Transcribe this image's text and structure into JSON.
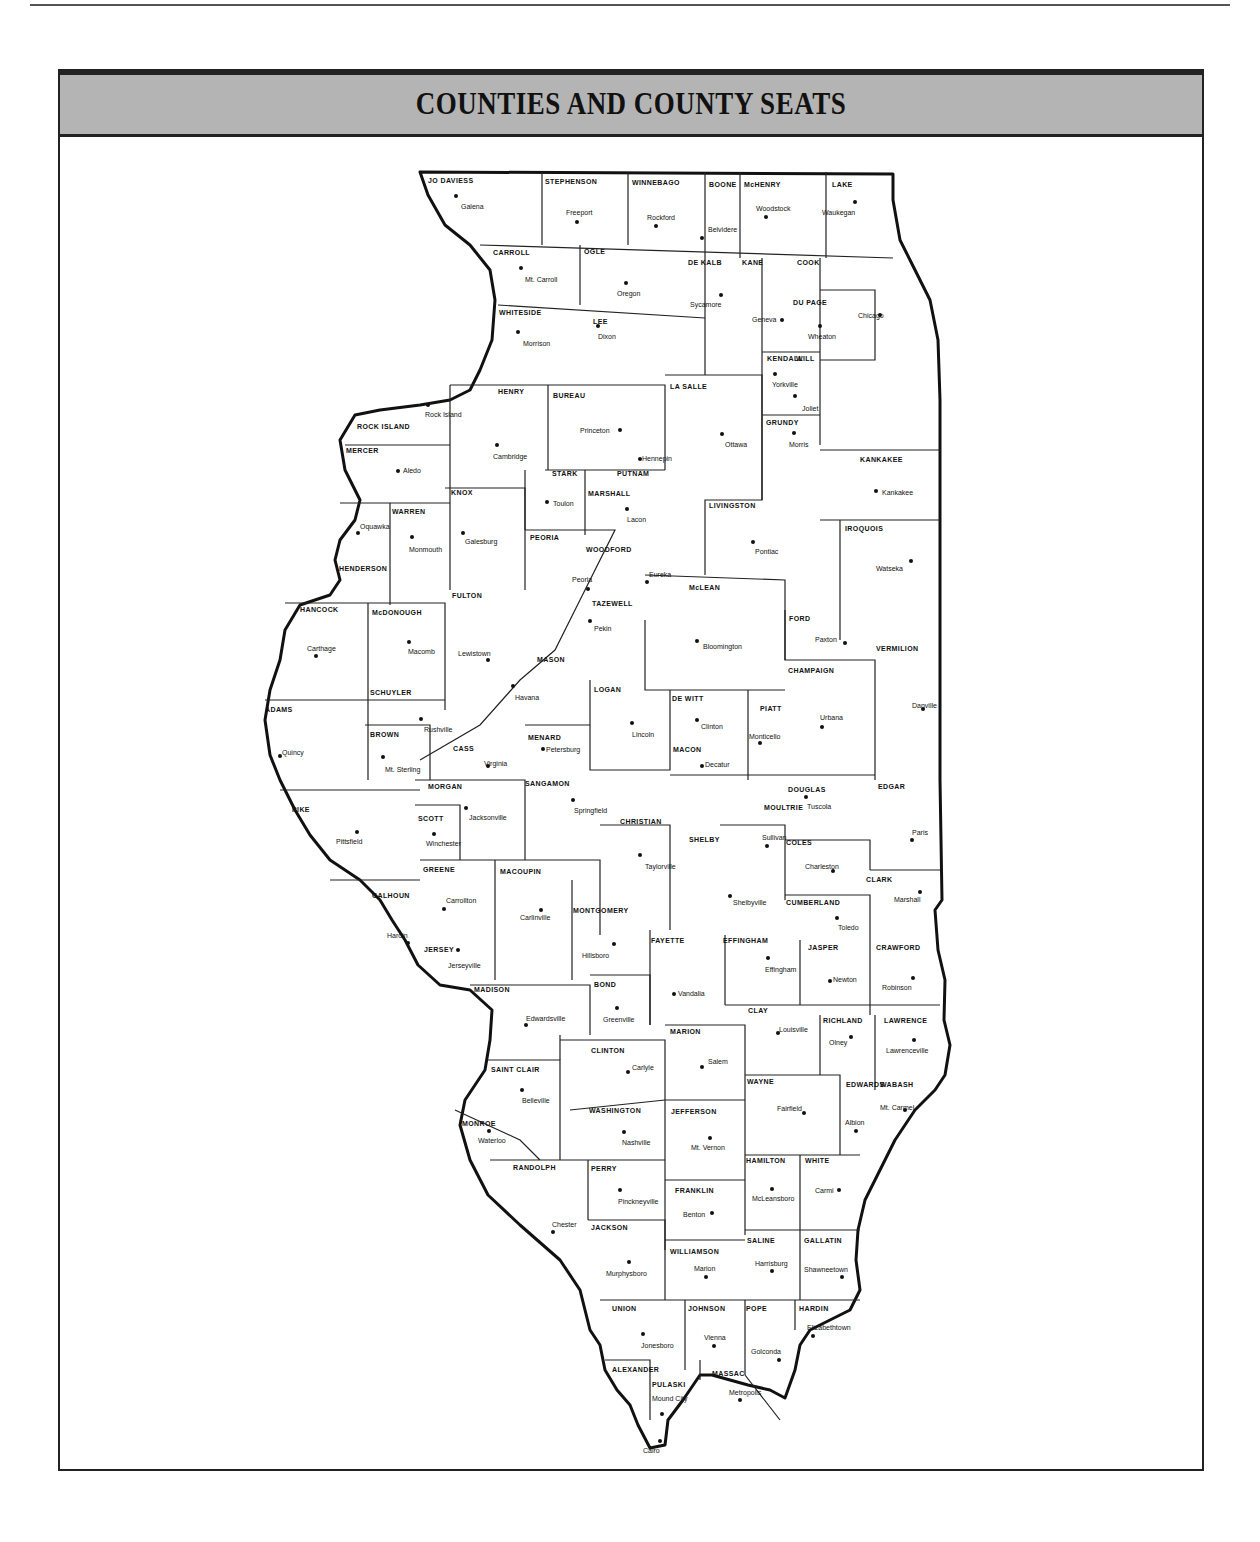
{
  "page": {
    "page_number": "279"
  },
  "title": "COUNTIES AND COUNTY SEATS",
  "colors": {
    "title_bar": "#b4b4b4",
    "border": "#222222",
    "ink": "#111111"
  },
  "counties": [
    {
      "name": "JO DAVIESS",
      "seat": "Galena",
      "nx": 428,
      "ny": 177,
      "sx": 461,
      "sy": 203,
      "dx": 456,
      "dy": 196
    },
    {
      "name": "STEPHENSON",
      "seat": "Freeport",
      "nx": 545,
      "ny": 178,
      "sx": 566,
      "sy": 209,
      "dx": 577,
      "dy": 222
    },
    {
      "name": "WINNEBAGO",
      "seat": "Rockford",
      "nx": 632,
      "ny": 179,
      "sx": 647,
      "sy": 214,
      "dx": 656,
      "dy": 226
    },
    {
      "name": "BOONE",
      "seat": "Belvidere",
      "nx": 709,
      "ny": 181,
      "sx": 708,
      "sy": 226,
      "dx": 702,
      "dy": 238
    },
    {
      "name": "McHENRY",
      "seat": "Woodstock",
      "nx": 744,
      "ny": 181,
      "sx": 756,
      "sy": 205,
      "dx": 766,
      "dy": 217
    },
    {
      "name": "LAKE",
      "seat": "Waukegan",
      "nx": 832,
      "ny": 181,
      "sx": 822,
      "sy": 209,
      "dx": 855,
      "dy": 202
    },
    {
      "name": "CARROLL",
      "seat": "Mt. Carroll",
      "nx": 493,
      "ny": 249,
      "sx": 525,
      "sy": 276,
      "dx": 521,
      "dy": 268
    },
    {
      "name": "OGLE",
      "seat": "Oregon",
      "nx": 584,
      "ny": 248,
      "sx": 617,
      "sy": 290,
      "dx": 626,
      "dy": 283
    },
    {
      "name": "DE KALB",
      "seat": "Sycamore",
      "nx": 688,
      "ny": 259,
      "sx": 690,
      "sy": 301,
      "dx": 721,
      "dy": 295
    },
    {
      "name": "KANE",
      "seat": "Geneva",
      "nx": 742,
      "ny": 259,
      "sx": 752,
      "sy": 316,
      "dx": 782,
      "dy": 320
    },
    {
      "name": "COOK",
      "seat": "Chicago",
      "nx": 797,
      "ny": 259,
      "sx": 858,
      "sy": 312,
      "dx": 880,
      "dy": 315
    },
    {
      "name": "DU PAGE",
      "seat": "Wheaton",
      "nx": 793,
      "ny": 299,
      "sx": 808,
      "sy": 333,
      "dx": 820,
      "dy": 326
    },
    {
      "name": "WHITESIDE",
      "seat": "Morrison",
      "nx": 499,
      "ny": 309,
      "sx": 523,
      "sy": 340,
      "dx": 518,
      "dy": 332
    },
    {
      "name": "LEE",
      "seat": "Dixon",
      "nx": 593,
      "ny": 318,
      "sx": 598,
      "sy": 333,
      "dx": 598,
      "dy": 326
    },
    {
      "name": "KENDALL",
      "seat": "Yorkville",
      "nx": 767,
      "ny": 355,
      "sx": 772,
      "sy": 381,
      "dx": 775,
      "dy": 374
    },
    {
      "name": "WILL",
      "seat": "Joliet",
      "nx": 796,
      "ny": 355,
      "sx": 802,
      "sy": 405,
      "dx": 795,
      "dy": 396
    },
    {
      "name": "HENRY",
      "seat": "Cambridge",
      "nx": 498,
      "ny": 388,
      "sx": 493,
      "sy": 453,
      "dx": 497,
      "dy": 445
    },
    {
      "name": "BUREAU",
      "seat": "Princeton",
      "nx": 553,
      "ny": 392,
      "sx": 580,
      "sy": 427,
      "dx": 620,
      "dy": 430
    },
    {
      "name": "LA SALLE",
      "seat": "Ottawa",
      "nx": 670,
      "ny": 383,
      "sx": 725,
      "sy": 441,
      "dx": 722,
      "dy": 434
    },
    {
      "name": "ROCK ISLAND",
      "seat": "Rock Island",
      "nx": 357,
      "ny": 423,
      "sx": 425,
      "sy": 411,
      "dx": 428,
      "dy": 405
    },
    {
      "name": "GRUNDY",
      "seat": "Morris",
      "nx": 766,
      "ny": 419,
      "sx": 789,
      "sy": 441,
      "dx": 794,
      "dy": 433
    },
    {
      "name": "MERCER",
      "seat": "Aledo",
      "nx": 346,
      "ny": 447,
      "sx": 403,
      "sy": 467,
      "dx": 398,
      "dy": 471
    },
    {
      "name": "STARK",
      "seat": "Toulon",
      "nx": 552,
      "ny": 470,
      "sx": 553,
      "sy": 500,
      "dx": 547,
      "dy": 502
    },
    {
      "name": "PUTNAM",
      "seat": "Hennepin",
      "nx": 617,
      "ny": 470,
      "sx": 642,
      "sy": 455,
      "dx": 640,
      "dy": 459
    },
    {
      "name": "KANKAKEE",
      "seat": "Kankakee",
      "nx": 860,
      "ny": 456,
      "sx": 882,
      "sy": 489,
      "dx": 876,
      "dy": 491
    },
    {
      "name": "KNOX",
      "seat": "Galesburg",
      "nx": 451,
      "ny": 489,
      "sx": 465,
      "sy": 538,
      "dx": 463,
      "dy": 533
    },
    {
      "name": "MARSHALL",
      "seat": "Lacon",
      "nx": 588,
      "ny": 490,
      "sx": 627,
      "sy": 516,
      "dx": 627,
      "dy": 509
    },
    {
      "name": "WARREN",
      "seat": "Monmouth",
      "nx": 392,
      "ny": 508,
      "sx": 409,
      "sy": 546,
      "dx": 412,
      "dy": 537
    },
    {
      "name": "LIVINGSTON",
      "seat": "Pontiac",
      "nx": 709,
      "ny": 502,
      "sx": 755,
      "sy": 548,
      "dx": 753,
      "dy": 542
    },
    {
      "name": "IROQUOIS",
      "seat": "Watseka",
      "nx": 845,
      "ny": 525,
      "sx": 876,
      "sy": 565,
      "dx": 911,
      "dy": 561
    },
    {
      "name": "PEORIA",
      "seat": "Peoria",
      "nx": 530,
      "ny": 534,
      "sx": 572,
      "sy": 576,
      "dx": 588,
      "dy": 589
    },
    {
      "name": "WOODFORD",
      "seat": "Eureka",
      "nx": 586,
      "ny": 546,
      "sx": 649,
      "sy": 571,
      "dx": 647,
      "dy": 582
    },
    {
      "name": "HENDERSON",
      "seat": "Oquawka",
      "nx": 339,
      "ny": 565,
      "sx": 360,
      "sy": 523,
      "dx": 358,
      "dy": 533
    },
    {
      "name": "FULTON",
      "seat": "Lewistown",
      "nx": 452,
      "ny": 592,
      "sx": 458,
      "sy": 650,
      "dx": 488,
      "dy": 660
    },
    {
      "name": "McLEAN",
      "seat": "Bloomington",
      "nx": 689,
      "ny": 584,
      "sx": 703,
      "sy": 643,
      "dx": 697,
      "dy": 641
    },
    {
      "name": "TAZEWELL",
      "seat": "Pekin",
      "nx": 592,
      "ny": 600,
      "sx": 594,
      "sy": 625,
      "dx": 590,
      "dy": 621
    },
    {
      "name": "HANCOCK",
      "seat": "Carthage",
      "nx": 300,
      "ny": 606,
      "sx": 307,
      "sy": 645,
      "dx": 316,
      "dy": 656
    },
    {
      "name": "McDONOUGH",
      "seat": "Macomb",
      "nx": 372,
      "ny": 609,
      "sx": 408,
      "sy": 648,
      "dx": 409,
      "dy": 642
    },
    {
      "name": "FORD",
      "seat": "Paxton",
      "nx": 789,
      "ny": 615,
      "sx": 815,
      "sy": 636,
      "dx": 845,
      "dy": 643
    },
    {
      "name": "VERMILION",
      "seat": "Danville",
      "nx": 876,
      "ny": 645,
      "sx": 912,
      "sy": 702,
      "dx": 923,
      "dy": 709
    },
    {
      "name": "CHAMPAIGN",
      "seat": "Urbana",
      "nx": 788,
      "ny": 667,
      "sx": 820,
      "sy": 714,
      "dx": 822,
      "dy": 727
    },
    {
      "name": "MASON",
      "seat": "Havana",
      "nx": 537,
      "ny": 656,
      "sx": 515,
      "sy": 694,
      "dx": 513,
      "dy": 686
    },
    {
      "name": "SCHUYLER",
      "seat": "Rushville",
      "nx": 370,
      "ny": 689,
      "sx": 424,
      "sy": 726,
      "dx": 421,
      "dy": 719
    },
    {
      "name": "LOGAN",
      "seat": "Lincoln",
      "nx": 594,
      "ny": 686,
      "sx": 632,
      "sy": 731,
      "dx": 632,
      "dy": 723
    },
    {
      "name": "DE WITT",
      "seat": "Clinton",
      "nx": 672,
      "ny": 695,
      "sx": 701,
      "sy": 723,
      "dx": 697,
      "dy": 720
    },
    {
      "name": "PIATT",
      "seat": "Monticello",
      "nx": 760,
      "ny": 705,
      "sx": 749,
      "sy": 733,
      "dx": 760,
      "dy": 743
    },
    {
      "name": "ADAMS",
      "seat": "Quincy",
      "nx": 265,
      "ny": 706,
      "sx": 282,
      "sy": 749,
      "dx": 280,
      "dy": 756
    },
    {
      "name": "BROWN",
      "seat": "Mt. Sterling",
      "nx": 370,
      "ny": 731,
      "sx": 385,
      "sy": 766,
      "dx": 383,
      "dy": 757
    },
    {
      "name": "CASS",
      "seat": "Virginia",
      "nx": 453,
      "ny": 745,
      "sx": 484,
      "sy": 760,
      "dx": 488,
      "dy": 766
    },
    {
      "name": "MENARD",
      "seat": "Petersburg",
      "nx": 528,
      "ny": 734,
      "sx": 546,
      "sy": 746,
      "dx": 543,
      "dy": 749
    },
    {
      "name": "MACON",
      "seat": "Decatur",
      "nx": 673,
      "ny": 746,
      "sx": 705,
      "sy": 761,
      "dx": 702,
      "dy": 766
    },
    {
      "name": "MORGAN",
      "seat": "Jacksonville",
      "nx": 428,
      "ny": 783,
      "sx": 469,
      "sy": 814,
      "dx": 466,
      "dy": 808
    },
    {
      "name": "SANGAMON",
      "seat": "Springfield",
      "nx": 525,
      "ny": 780,
      "sx": 574,
      "sy": 807,
      "dx": 573,
      "dy": 800
    },
    {
      "name": "DOUGLAS",
      "seat": "Tuscola",
      "nx": 788,
      "ny": 786,
      "sx": 807,
      "sy": 803,
      "dx": 806,
      "dy": 797
    },
    {
      "name": "EDGAR",
      "seat": "Paris",
      "nx": 878,
      "ny": 783,
      "sx": 912,
      "sy": 829,
      "dx": 912,
      "dy": 840
    },
    {
      "name": "PIKE",
      "seat": "Pittsfield",
      "nx": 292,
      "ny": 806,
      "sx": 336,
      "sy": 838,
      "dx": 357,
      "dy": 832
    },
    {
      "name": "SCOTT",
      "seat": "Winchester",
      "nx": 418,
      "ny": 815,
      "sx": 426,
      "sy": 840,
      "dx": 434,
      "dy": 834
    },
    {
      "name": "MOULTRIE",
      "seat": "Sullivan",
      "nx": 764,
      "ny": 804,
      "sx": 762,
      "sy": 834,
      "dx": 767,
      "dy": 846
    },
    {
      "name": "CHRISTIAN",
      "seat": "Taylorville",
      "nx": 620,
      "ny": 818,
      "sx": 645,
      "sy": 863,
      "dx": 640,
      "dy": 855
    },
    {
      "name": "SHELBY",
      "seat": "Shelbyville",
      "nx": 689,
      "ny": 836,
      "sx": 733,
      "sy": 899,
      "dx": 730,
      "dy": 896
    },
    {
      "name": "COLES",
      "seat": "Charleston",
      "nx": 786,
      "ny": 839,
      "sx": 805,
      "sy": 863,
      "dx": 833,
      "dy": 871
    },
    {
      "name": "GREENE",
      "seat": "Carrollton",
      "nx": 423,
      "ny": 866,
      "sx": 446,
      "sy": 897,
      "dx": 444,
      "dy": 909
    },
    {
      "name": "MACOUPIN",
      "seat": "Carlinville",
      "nx": 500,
      "ny": 868,
      "sx": 520,
      "sy": 914,
      "dx": 541,
      "dy": 910
    },
    {
      "name": "CALHOUN",
      "seat": "Hardin",
      "nx": 372,
      "ny": 892,
      "sx": 387,
      "sy": 932,
      "dx": 408,
      "dy": 943
    },
    {
      "name": "CLARK",
      "seat": "Marshall",
      "nx": 866,
      "ny": 876,
      "sx": 894,
      "sy": 896,
      "dx": 920,
      "dy": 892
    },
    {
      "name": "CUMBERLAND",
      "seat": "Toledo",
      "nx": 786,
      "ny": 899,
      "sx": 838,
      "sy": 924,
      "dx": 837,
      "dy": 918
    },
    {
      "name": "MONTGOMERY",
      "seat": "Hillsboro",
      "nx": 573,
      "ny": 907,
      "sx": 582,
      "sy": 952,
      "dx": 614,
      "dy": 944
    },
    {
      "name": "FAYETTE",
      "seat": "Vandalia",
      "nx": 651,
      "ny": 937,
      "sx": 678,
      "sy": 990,
      "dx": 674,
      "dy": 994
    },
    {
      "name": "EFFINGHAM",
      "seat": "Effingham",
      "nx": 723,
      "ny": 937,
      "sx": 765,
      "sy": 966,
      "dx": 768,
      "dy": 958
    },
    {
      "name": "JASPER",
      "seat": "Newton",
      "nx": 808,
      "ny": 944,
      "sx": 833,
      "sy": 976,
      "dx": 830,
      "dy": 981
    },
    {
      "name": "CRAWFORD",
      "seat": "Robinson",
      "nx": 876,
      "ny": 944,
      "sx": 882,
      "sy": 984,
      "dx": 913,
      "dy": 978
    },
    {
      "name": "JERSEY",
      "seat": "Jerseyville",
      "nx": 424,
      "ny": 946,
      "sx": 448,
      "sy": 962,
      "dx": 458,
      "dy": 950
    },
    {
      "name": "MADISON",
      "seat": "Edwardsville",
      "nx": 474,
      "ny": 986,
      "sx": 526,
      "sy": 1015,
      "dx": 526,
      "dy": 1025
    },
    {
      "name": "BOND",
      "seat": "Greenville",
      "nx": 594,
      "ny": 981,
      "sx": 603,
      "sy": 1016,
      "dx": 617,
      "dy": 1008
    },
    {
      "name": "CLAY",
      "seat": "Louisville",
      "nx": 748,
      "ny": 1007,
      "sx": 779,
      "sy": 1026,
      "dx": 778,
      "dy": 1033
    },
    {
      "name": "RICHLAND",
      "seat": "Olney",
      "nx": 823,
      "ny": 1017,
      "sx": 829,
      "sy": 1039,
      "dx": 851,
      "dy": 1037
    },
    {
      "name": "LAWRENCE",
      "seat": "Lawrenceville",
      "nx": 884,
      "ny": 1017,
      "sx": 886,
      "sy": 1047,
      "dx": 914,
      "dy": 1040
    },
    {
      "name": "MARION",
      "seat": "Salem",
      "nx": 670,
      "ny": 1028,
      "sx": 708,
      "sy": 1058,
      "dx": 702,
      "dy": 1067
    },
    {
      "name": "CLINTON",
      "seat": "Carlyle",
      "nx": 591,
      "ny": 1047,
      "sx": 632,
      "sy": 1064,
      "dx": 628,
      "dy": 1072
    },
    {
      "name": "SAINT CLAIR",
      "seat": "Belleville",
      "nx": 491,
      "ny": 1066,
      "sx": 522,
      "sy": 1097,
      "dx": 522,
      "dy": 1090
    },
    {
      "name": "WAYNE",
      "seat": "Fairfield",
      "nx": 747,
      "ny": 1078,
      "sx": 777,
      "sy": 1105,
      "dx": 804,
      "dy": 1113
    },
    {
      "name": "EDWARDS",
      "seat": "Albion",
      "nx": 846,
      "ny": 1081,
      "sx": 845,
      "sy": 1119,
      "dx": 856,
      "dy": 1131
    },
    {
      "name": "WABASH",
      "seat": "Mt. Carmel",
      "nx": 880,
      "ny": 1081,
      "sx": 880,
      "sy": 1104,
      "dx": 905,
      "dy": 1110
    },
    {
      "name": "WASHINGTON",
      "seat": "Nashville",
      "nx": 589,
      "ny": 1107,
      "sx": 622,
      "sy": 1139,
      "dx": 624,
      "dy": 1132
    },
    {
      "name": "JEFFERSON",
      "seat": "Mt. Vernon",
      "nx": 671,
      "ny": 1108,
      "sx": 691,
      "sy": 1144,
      "dx": 710,
      "dy": 1138
    },
    {
      "name": "MONROE",
      "seat": "Waterloo",
      "nx": 462,
      "ny": 1120,
      "sx": 478,
      "sy": 1137,
      "dx": 489,
      "dy": 1131
    },
    {
      "name": "HAMILTON",
      "seat": "McLeansboro",
      "nx": 746,
      "ny": 1157,
      "sx": 752,
      "sy": 1195,
      "dx": 772,
      "dy": 1189
    },
    {
      "name": "WHITE",
      "seat": "Carmi",
      "nx": 805,
      "ny": 1157,
      "sx": 815,
      "sy": 1187,
      "dx": 839,
      "dy": 1190
    },
    {
      "name": "RANDOLPH",
      "seat": "Chester",
      "nx": 513,
      "ny": 1164,
      "sx": 552,
      "sy": 1221,
      "dx": 553,
      "dy": 1232
    },
    {
      "name": "PERRY",
      "seat": "Pinckneyville",
      "nx": 591,
      "ny": 1165,
      "sx": 618,
      "sy": 1198,
      "dx": 620,
      "dy": 1190
    },
    {
      "name": "FRANKLIN",
      "seat": "Benton",
      "nx": 675,
      "ny": 1187,
      "sx": 683,
      "sy": 1211,
      "dx": 712,
      "dy": 1213
    },
    {
      "name": "JACKSON",
      "seat": "Murphysboro",
      "nx": 591,
      "ny": 1224,
      "sx": 606,
      "sy": 1270,
      "dx": 629,
      "dy": 1262
    },
    {
      "name": "WILLIAMSON",
      "seat": "Marion",
      "nx": 670,
      "ny": 1248,
      "sx": 694,
      "sy": 1265,
      "dx": 706,
      "dy": 1277
    },
    {
      "name": "SALINE",
      "seat": "Harrisburg",
      "nx": 747,
      "ny": 1237,
      "sx": 755,
      "sy": 1260,
      "dx": 772,
      "dy": 1271
    },
    {
      "name": "GALLATIN",
      "seat": "Shawneetown",
      "nx": 804,
      "ny": 1237,
      "sx": 804,
      "sy": 1266,
      "dx": 842,
      "dy": 1277
    },
    {
      "name": "UNION",
      "seat": "Jonesboro",
      "nx": 612,
      "ny": 1305,
      "sx": 641,
      "sy": 1342,
      "dx": 643,
      "dy": 1334
    },
    {
      "name": "JOHNSON",
      "seat": "Vienna",
      "nx": 688,
      "ny": 1305,
      "sx": 704,
      "sy": 1334,
      "dx": 714,
      "dy": 1346
    },
    {
      "name": "POPE",
      "seat": "Golconda",
      "nx": 746,
      "ny": 1305,
      "sx": 751,
      "sy": 1348,
      "dx": 779,
      "dy": 1360
    },
    {
      "name": "HARDIN",
      "seat": "Elizabethtown",
      "nx": 799,
      "ny": 1305,
      "sx": 807,
      "sy": 1324,
      "dx": 813,
      "dy": 1336
    },
    {
      "name": "ALEXANDER",
      "seat": "Cairo",
      "nx": 612,
      "ny": 1366,
      "sx": 643,
      "sy": 1447,
      "dx": 660,
      "dy": 1441
    },
    {
      "name": "PULASKI",
      "seat": "Mound City",
      "nx": 652,
      "ny": 1381,
      "sx": 652,
      "sy": 1395,
      "dx": 662,
      "dy": 1414
    },
    {
      "name": "MASSAC",
      "seat": "Metropolis",
      "nx": 712,
      "ny": 1370,
      "sx": 729,
      "sy": 1389,
      "dx": 740,
      "dy": 1400
    }
  ]
}
